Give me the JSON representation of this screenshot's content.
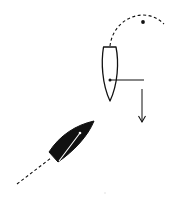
{
  "diagram": {
    "title": "",
    "background": "#ffffff",
    "ink_color": "#111111",
    "elements": {
      "white_boat": {
        "label": "",
        "fill": "#ffffff",
        "stroke": "#111111",
        "heading": "south",
        "stern": {
          "x1": 103,
          "x2": 116,
          "y": 47
        },
        "bow": {
          "x": 110,
          "y": 101
        },
        "mast_dot": {
          "x": 110,
          "y": 80
        }
      },
      "boom_line": {
        "x1": 110,
        "y1": 80,
        "x2": 144,
        "y2": 80
      },
      "drift_arrow": {
        "x": 142,
        "y1": 89,
        "y2": 122,
        "direction": "down"
      },
      "dashed_arc_track": {
        "start": {
          "x": 110,
          "y": 46
        },
        "end": {
          "x": 164,
          "y": 24
        }
      },
      "mark_dot": {
        "x": 143,
        "y": 22
      },
      "black_boat": {
        "label": "",
        "fill": "#111111",
        "heading": "north-east",
        "bow": {
          "x": 94,
          "y": 121
        },
        "stern_left": {
          "x": 49,
          "y": 152
        },
        "stern_right": {
          "x": 58,
          "y": 162
        },
        "boom": {
          "x1": 80,
          "y1": 133,
          "x2": 59,
          "y2": 161
        }
      },
      "dashed_wake": {
        "x1": 17,
        "y1": 184,
        "x2": 51,
        "y2": 158
      }
    }
  }
}
